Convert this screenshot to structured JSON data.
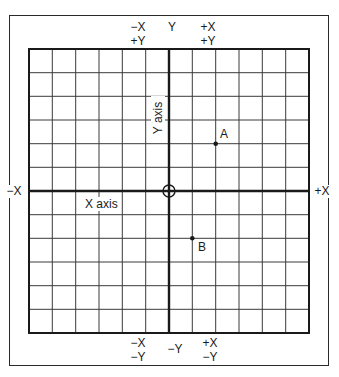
{
  "diagram": {
    "title": "",
    "grid": {
      "columns": 12,
      "rows": 12
    },
    "colors": {
      "line": "#1a1a1a",
      "grid": "#3a3a3a",
      "background": "#ffffff"
    },
    "axes": {
      "x_label": "X axis",
      "y_label": "Y axis",
      "origin_marker": "circle-crosshair"
    },
    "quadrant_labels": {
      "top_left": {
        "line1": "−X",
        "line2": "+Y"
      },
      "top_center": "Y",
      "top_right": {
        "line1": "+X",
        "line2": "+Y"
      },
      "bottom_left": {
        "line1": "−X",
        "line2": "−Y"
      },
      "bottom_center": "−Y",
      "bottom_right": {
        "line1": "+X",
        "line2": "−Y"
      },
      "left": "−X",
      "right": "+X"
    },
    "points": [
      {
        "name": "A",
        "grid_x": 2,
        "grid_y": 2
      },
      {
        "name": "B",
        "grid_x": 1,
        "grid_y": -2
      }
    ]
  }
}
